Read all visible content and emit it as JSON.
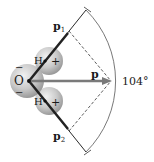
{
  "figure": {
    "atoms": {
      "oxygen": "O",
      "hydrogen_top": "H",
      "hydrogen_bottom": "H",
      "oxygen_charge": "−",
      "hydrogen_charge": "+"
    },
    "vectors": {
      "p1": {
        "label": "p",
        "sub": "1"
      },
      "p2": {
        "label": "p",
        "sub": "2"
      },
      "p": {
        "label": "p"
      }
    },
    "angle_label": "104°",
    "colors": {
      "bond_line": "#2a2a2a",
      "arrow_p": "#7a7a7a",
      "sphere": "#c8c8c8",
      "arc": "#555555"
    }
  }
}
